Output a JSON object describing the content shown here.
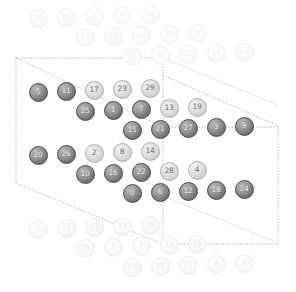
{
  "figure": {
    "type": "lattice-torus-diagram",
    "width": 296,
    "height": 292,
    "background": "#ffffff",
    "node_radius": 9.5,
    "colors": {
      "dark_fill": "#737373",
      "dark_stroke": "#4a4a4a",
      "dark_label": "#ffffff",
      "mid_fill": "#cfcfcf",
      "mid_stroke": "#b0b0b0",
      "mid_label": "#6e6e6e",
      "ghost_fill": "#f7f7f7",
      "ghost_label": "#f0f0f0",
      "boundary_stroke": "#9a9a9a",
      "solid_stroke": "#e4e4e4"
    }
  },
  "boundaries": {
    "outer_cell": {
      "style": "dotted",
      "points": "16,58 163,58 278,126 278,244 163,244 16,183"
    },
    "paths": [
      {
        "name": "outer-top-edge",
        "style": "dotted",
        "d": "M16,58 L163,58"
      },
      {
        "name": "outer-left-edge",
        "style": "dotted",
        "d": "M16,58 L16,183"
      },
      {
        "name": "outer-diagonal-upper",
        "style": "dotted",
        "d": "M16,58 L163,127"
      },
      {
        "name": "outer-diagonal-right",
        "style": "dotted",
        "d": "M163,75 L278,126"
      },
      {
        "name": "outer-right-edge",
        "style": "dotted",
        "d": "M278,126 L278,244"
      },
      {
        "name": "outer-bottom-edge",
        "style": "dotted",
        "d": "M163,244 L278,244"
      },
      {
        "name": "outer-diagonal-lower",
        "style": "dotted",
        "d": "M16,183 L163,244"
      },
      {
        "name": "inner-vertical",
        "style": "dotted",
        "d": "M163,58 L163,244"
      },
      {
        "name": "inner-horizontal",
        "style": "dotted",
        "d": "M163,127 L278,127"
      },
      {
        "name": "solid-diagonal-right",
        "style": "solid",
        "d": "M163,196 L278,243"
      },
      {
        "name": "solid-diagonal-top",
        "style": "solid",
        "d": "M163,58 L278,105"
      }
    ]
  },
  "legend": {
    "rows": 6,
    "cols": 5,
    "total_nodes": 30,
    "modulus": 30
  },
  "chart_data": {
    "type": "scatter",
    "title": "",
    "xlabel": "",
    "ylabel": "",
    "grid": false,
    "legend": "none",
    "series": [
      {
        "name": "fundamental-domain",
        "nodes": [
          {
            "label": "5",
            "x": 38,
            "y": 92,
            "shade": "dark"
          },
          {
            "label": "11",
            "x": 66,
            "y": 91,
            "shade": "dark"
          },
          {
            "label": "17",
            "x": 94,
            "y": 90,
            "shade": "mid"
          },
          {
            "label": "23",
            "x": 122,
            "y": 89,
            "shade": "mid"
          },
          {
            "label": "29",
            "x": 150,
            "y": 88,
            "shade": "mid"
          },
          {
            "label": "25",
            "x": 85,
            "y": 111,
            "shade": "dark"
          },
          {
            "label": "1",
            "x": 113,
            "y": 110,
            "shade": "dark"
          },
          {
            "label": "7",
            "x": 141,
            "y": 109,
            "shade": "dark"
          },
          {
            "label": "13",
            "x": 169,
            "y": 108,
            "shade": "mid"
          },
          {
            "label": "19",
            "x": 197,
            "y": 107,
            "shade": "mid"
          },
          {
            "label": "15",
            "x": 132,
            "y": 130,
            "shade": "dark"
          },
          {
            "label": "21",
            "x": 160,
            "y": 129,
            "shade": "dark"
          },
          {
            "label": "27",
            "x": 188,
            "y": 128,
            "shade": "dark"
          },
          {
            "label": "3",
            "x": 216,
            "y": 127,
            "shade": "dark"
          },
          {
            "label": "9",
            "x": 244,
            "y": 126,
            "shade": "dark"
          },
          {
            "label": "20",
            "x": 38,
            "y": 155,
            "shade": "dark"
          },
          {
            "label": "26",
            "x": 66,
            "y": 154,
            "shade": "dark"
          },
          {
            "label": "2",
            "x": 94,
            "y": 153,
            "shade": "mid"
          },
          {
            "label": "8",
            "x": 122,
            "y": 152,
            "shade": "mid"
          },
          {
            "label": "14",
            "x": 150,
            "y": 151,
            "shade": "mid"
          },
          {
            "label": "10",
            "x": 85,
            "y": 174,
            "shade": "dark"
          },
          {
            "label": "16",
            "x": 113,
            "y": 173,
            "shade": "dark"
          },
          {
            "label": "22",
            "x": 141,
            "y": 172,
            "shade": "dark"
          },
          {
            "label": "28",
            "x": 169,
            "y": 171,
            "shade": "mid"
          },
          {
            "label": "4",
            "x": 197,
            "y": 170,
            "shade": "mid"
          },
          {
            "label": "0",
            "x": 132,
            "y": 193,
            "shade": "dark"
          },
          {
            "label": "6",
            "x": 160,
            "y": 192,
            "shade": "dark"
          },
          {
            "label": "12",
            "x": 188,
            "y": 191,
            "shade": "dark"
          },
          {
            "label": "18",
            "x": 216,
            "y": 190,
            "shade": "dark"
          },
          {
            "label": "24",
            "x": 244,
            "y": 189,
            "shade": "dark"
          }
        ]
      },
      {
        "name": "periodic-copies",
        "nodes": [
          {
            "label": "20",
            "x": 38,
            "y": 18,
            "shade": "ghost"
          },
          {
            "label": "26",
            "x": 66,
            "y": 17,
            "shade": "ghost"
          },
          {
            "label": "2",
            "x": 94,
            "y": 16,
            "shade": "ghost"
          },
          {
            "label": "8",
            "x": 122,
            "y": 15,
            "shade": "ghost"
          },
          {
            "label": "14",
            "x": 150,
            "y": 14,
            "shade": "ghost"
          },
          {
            "label": "10",
            "x": 85,
            "y": 37,
            "shade": "ghost"
          },
          {
            "label": "16",
            "x": 113,
            "y": 36,
            "shade": "ghost"
          },
          {
            "label": "22",
            "x": 141,
            "y": 35,
            "shade": "ghost"
          },
          {
            "label": "28",
            "x": 169,
            "y": 34,
            "shade": "ghost"
          },
          {
            "label": "4",
            "x": 197,
            "y": 33,
            "shade": "ghost"
          },
          {
            "label": "0",
            "x": 132,
            "y": 56,
            "shade": "ghost"
          },
          {
            "label": "6",
            "x": 160,
            "y": 55,
            "shade": "ghost"
          },
          {
            "label": "12",
            "x": 188,
            "y": 54,
            "shade": "ghost"
          },
          {
            "label": "18",
            "x": 216,
            "y": 53,
            "shade": "ghost"
          },
          {
            "label": "24",
            "x": 244,
            "y": 52,
            "shade": "ghost"
          },
          {
            "label": "5",
            "x": 38,
            "y": 229,
            "shade": "ghost2"
          },
          {
            "label": "11",
            "x": 66,
            "y": 228,
            "shade": "ghost2"
          },
          {
            "label": "17",
            "x": 94,
            "y": 227,
            "shade": "ghost2"
          },
          {
            "label": "23",
            "x": 122,
            "y": 226,
            "shade": "ghost2"
          },
          {
            "label": "29",
            "x": 150,
            "y": 225,
            "shade": "ghost2"
          },
          {
            "label": "25",
            "x": 85,
            "y": 248,
            "shade": "ghost2"
          },
          {
            "label": "1",
            "x": 113,
            "y": 247,
            "shade": "ghost2"
          },
          {
            "label": "7",
            "x": 141,
            "y": 246,
            "shade": "ghost2"
          },
          {
            "label": "13",
            "x": 169,
            "y": 245,
            "shade": "ghost2"
          },
          {
            "label": "19",
            "x": 197,
            "y": 244,
            "shade": "ghost2"
          },
          {
            "label": "15",
            "x": 132,
            "y": 267,
            "shade": "ghost2"
          },
          {
            "label": "21",
            "x": 160,
            "y": 266,
            "shade": "ghost2"
          },
          {
            "label": "27",
            "x": 188,
            "y": 265,
            "shade": "ghost2"
          },
          {
            "label": "3",
            "x": 216,
            "y": 264,
            "shade": "ghost2"
          },
          {
            "label": "9",
            "x": 244,
            "y": 263,
            "shade": "ghost2"
          }
        ]
      }
    ]
  }
}
